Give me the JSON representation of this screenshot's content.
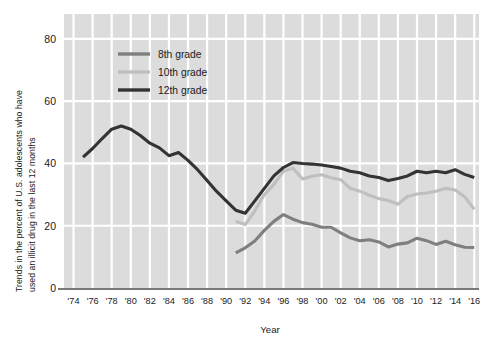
{
  "chart_data": {
    "type": "line",
    "title": "",
    "xlabel": "Year",
    "ylabel": "Trends in the percent of U.S. adolescents who have used an illicit drug in the last 12 months",
    "ylabel_line1": "Trends in the percent of U.S. adolescents  who have",
    "ylabel_line2": "used an illicit drug in the last 12 months",
    "xlim": [
      1973,
      2016.5
    ],
    "ylim": [
      0,
      88
    ],
    "yticks": [
      0,
      20,
      40,
      60,
      80
    ],
    "ytick_labels": [
      "0",
      "20",
      "40",
      "60",
      "80"
    ],
    "xticks": [
      1974,
      1976,
      1978,
      1980,
      1982,
      1984,
      1986,
      1988,
      1990,
      1992,
      1994,
      1996,
      1998,
      2000,
      2002,
      2004,
      2006,
      2008,
      2010,
      2012,
      2014,
      2016
    ],
    "xtick_labels": [
      "'74",
      "'76",
      "'78",
      "'80",
      "'82",
      "'84",
      "'86",
      "'88",
      "'90",
      "'92",
      "'94",
      "'96",
      "'98",
      "'00",
      "'02",
      "'04",
      "'06",
      "'08",
      "'10",
      "'12",
      "'14",
      "'16"
    ],
    "grid": true,
    "grid_color": "#ffffff",
    "plot_bg": "#dcdcdc",
    "legend_position": "top-left-inside",
    "series": [
      {
        "name": "8th grade",
        "color": "#7f7f7f",
        "x": [
          1991,
          1992,
          1993,
          1994,
          1995,
          1996,
          1997,
          1998,
          1999,
          2000,
          2001,
          2002,
          2003,
          2004,
          2005,
          2006,
          2007,
          2008,
          2009,
          2010,
          2011,
          2012,
          2013,
          2014,
          2015,
          2016
        ],
        "values": [
          11.3,
          12.9,
          15.1,
          18.5,
          21.4,
          23.6,
          22.1,
          21.0,
          20.5,
          19.5,
          19.5,
          17.7,
          16.1,
          15.2,
          15.5,
          14.8,
          13.2,
          14.1,
          14.5,
          16.0,
          15.2,
          14.0,
          15.0,
          13.9,
          13.1,
          13.0
        ]
      },
      {
        "name": "10th grade",
        "color": "#bfbfbf",
        "x": [
          1991,
          1992,
          1993,
          1994,
          1995,
          1996,
          1997,
          1998,
          1999,
          2000,
          2001,
          2002,
          2003,
          2004,
          2005,
          2006,
          2007,
          2008,
          2009,
          2010,
          2011,
          2012,
          2013,
          2014,
          2015,
          2016
        ],
        "values": [
          21.4,
          20.4,
          24.7,
          30.0,
          33.3,
          37.5,
          38.5,
          35.0,
          35.9,
          36.4,
          35.4,
          34.8,
          32.0,
          31.1,
          29.8,
          28.7,
          28.1,
          26.9,
          29.4,
          30.2,
          30.5,
          31.1,
          32.0,
          31.5,
          29.3,
          25.3
        ]
      },
      {
        "name": "12th grade",
        "color": "#333333",
        "x": [
          1975,
          1976,
          1977,
          1978,
          1979,
          1980,
          1981,
          1982,
          1983,
          1984,
          1985,
          1986,
          1987,
          1988,
          1989,
          1990,
          1991,
          1992,
          1993,
          1994,
          1995,
          1996,
          1997,
          1998,
          1999,
          2000,
          2001,
          2002,
          2003,
          2004,
          2005,
          2006,
          2007,
          2008,
          2009,
          2010,
          2011,
          2012,
          2013,
          2014,
          2015,
          2016
        ],
        "values": [
          42.0,
          44.8,
          48.0,
          51.0,
          52.0,
          51.0,
          49.0,
          46.5,
          45.0,
          42.5,
          43.5,
          41.0,
          38.0,
          34.5,
          31.0,
          28.0,
          25.0,
          24.0,
          28.0,
          32.0,
          36.0,
          38.7,
          40.3,
          40.0,
          39.8,
          39.5,
          39.0,
          38.5,
          37.5,
          37.0,
          36.0,
          35.5,
          34.5,
          35.2,
          36.0,
          37.5,
          37.0,
          37.5,
          37.0,
          38.0,
          36.5,
          35.5
        ]
      }
    ]
  },
  "legend": {
    "items": [
      {
        "label": "8th grade",
        "color": "#7f7f7f"
      },
      {
        "label": "10th grade",
        "color": "#bfbfbf"
      },
      {
        "label": "12th grade",
        "color": "#333333"
      }
    ]
  }
}
